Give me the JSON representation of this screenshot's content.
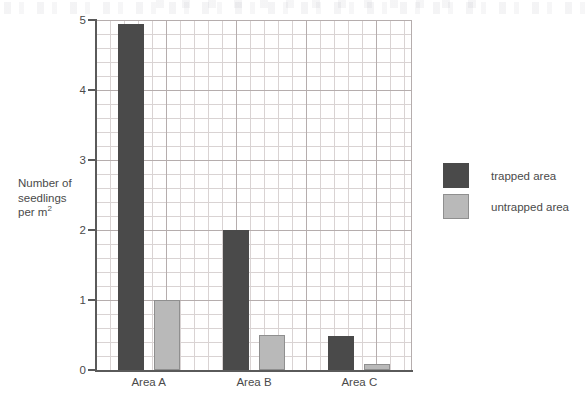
{
  "chart_data": {
    "type": "bar",
    "title": "",
    "xlabel": "",
    "ylabel_lines": [
      "Number of",
      "seedlings",
      "per m"
    ],
    "ylabel_superscript": "2",
    "ylabel": "Number of seedlings per m2",
    "categories": [
      "Area A",
      "Area B",
      "Area C"
    ],
    "series": [
      {
        "name": "trapped area",
        "color": "#4a4a4a",
        "values": [
          4.95,
          2.0,
          0.48
        ]
      },
      {
        "name": "untrapped area",
        "color": "#b9b9b9",
        "values": [
          1.0,
          0.5,
          0.08
        ]
      }
    ],
    "ylim": [
      0,
      5
    ],
    "yticks": [
      0,
      1,
      2,
      3,
      4,
      5
    ],
    "ytick_labels": [
      "0",
      "1",
      "2",
      "3",
      "4",
      "5"
    ],
    "grid": true,
    "grid_minor": true,
    "legend_position": "right"
  },
  "legend": {
    "items": [
      {
        "label": "trapped area"
      },
      {
        "label": "untrapped area"
      }
    ]
  }
}
